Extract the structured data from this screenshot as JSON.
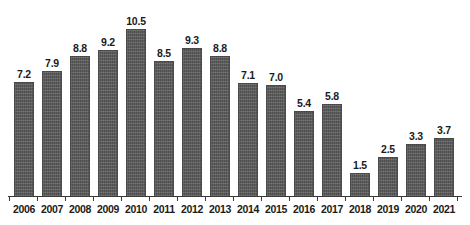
{
  "chart_data": {
    "type": "bar",
    "title": "",
    "subtitle": "",
    "xlabel": "",
    "ylabel": "",
    "categories": [
      "2006",
      "2007",
      "2008",
      "2009",
      "2010",
      "2011",
      "2012",
      "2013",
      "2014",
      "2015",
      "2016",
      "2017",
      "2018",
      "2019",
      "2020",
      "2021"
    ],
    "values": [
      7.2,
      7.9,
      8.8,
      9.2,
      10.5,
      8.5,
      9.3,
      8.8,
      7.1,
      7.0,
      5.4,
      5.8,
      1.5,
      2.5,
      3.3,
      3.7
    ],
    "data_labels": [
      "7.2",
      "7.9",
      "8.8",
      "9.2",
      "10.5",
      "8.5",
      "9.3",
      "8.8",
      "7.1",
      "7.0",
      "5.4",
      "5.8",
      "1.5",
      "2.5",
      "3.3",
      "3.7"
    ],
    "ylim": [
      0,
      12.3
    ],
    "xlim_labels": [
      "2006",
      "2021"
    ],
    "grid": false,
    "legend": null,
    "legend_position": "none",
    "bar_color": "#585858",
    "bar_edge_color": "#4a4a4a",
    "label_color": "#1a1a1a",
    "axis_color": "#3a3a3a",
    "background_color": "#ffffff",
    "axis_ticks_between_bars": true,
    "value_labels_above_bars": true
  }
}
